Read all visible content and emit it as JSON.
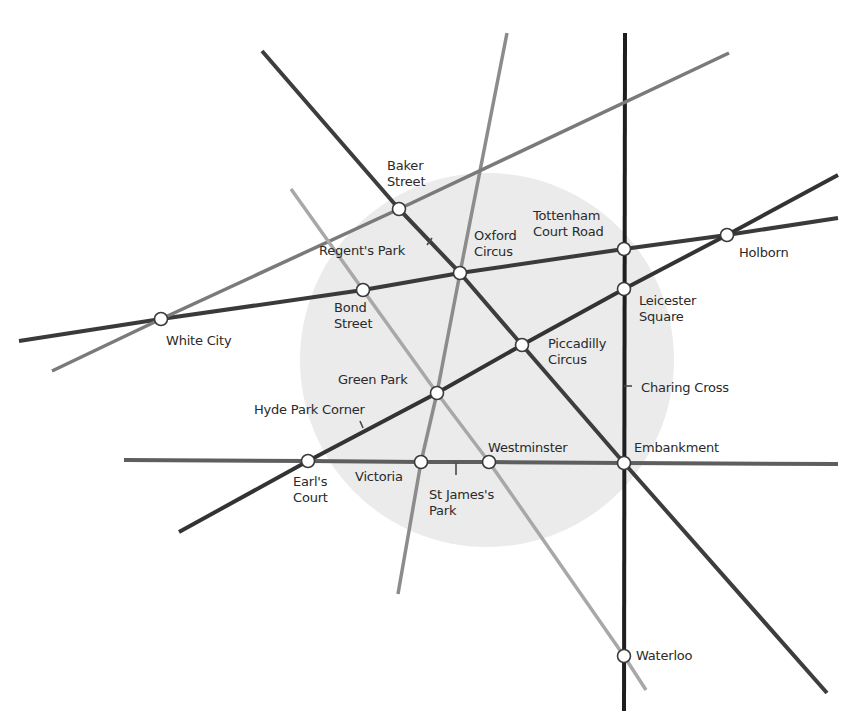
{
  "map": {
    "colors": {
      "background": "#ffffff",
      "zone_fill": "#ebebeb",
      "station_fill": "#ffffff",
      "station_stroke": "#3a3a3a",
      "label": "#2a2a2a"
    },
    "zone": {
      "cx": 487,
      "cy": 360,
      "r": 187
    },
    "lines": [
      {
        "id": "northern",
        "color": "#1e1e1e",
        "width": 4,
        "points": [
          [
            625,
            33
          ],
          [
            624,
            711
          ]
        ]
      },
      {
        "id": "bakerloo",
        "color": "#3d3d3d",
        "width": 4,
        "points": [
          [
            262,
            51
          ],
          [
            399,
            209
          ],
          [
            460,
            273
          ],
          [
            522,
            345
          ],
          [
            624,
            463
          ],
          [
            827,
            693
          ]
        ]
      },
      {
        "id": "central",
        "color": "#3a3a3a",
        "width": 4,
        "points": [
          [
            19,
            341
          ],
          [
            161,
            319
          ],
          [
            363,
            290
          ],
          [
            460,
            273
          ],
          [
            624,
            249
          ],
          [
            727,
            235
          ],
          [
            838,
            218
          ]
        ]
      },
      {
        "id": "piccadilly",
        "color": "#333333",
        "width": 4,
        "points": [
          [
            179,
            532
          ],
          [
            308,
            461
          ],
          [
            437,
            393
          ],
          [
            522,
            345
          ],
          [
            624,
            289
          ],
          [
            727,
            235
          ],
          [
            838,
            175
          ]
        ]
      },
      {
        "id": "district",
        "color": "#5e5e5e",
        "width": 4,
        "points": [
          [
            124,
            460
          ],
          [
            308,
            461
          ],
          [
            421,
            462
          ],
          [
            489,
            462
          ],
          [
            624,
            463
          ],
          [
            838,
            464
          ]
        ]
      },
      {
        "id": "victoria",
        "color": "#8c8c8c",
        "width": 3.5,
        "points": [
          [
            507,
            33
          ],
          [
            460,
            273
          ],
          [
            437,
            393
          ],
          [
            421,
            462
          ],
          [
            398,
            594
          ]
        ]
      },
      {
        "id": "metropolitan",
        "color": "#7a7a7a",
        "width": 3.5,
        "points": [
          [
            52,
            371
          ],
          [
            161,
            319
          ],
          [
            399,
            209
          ],
          [
            729,
            53
          ]
        ]
      },
      {
        "id": "jubilee",
        "color": "#a8a8a8",
        "width": 3.5,
        "points": [
          [
            291,
            189
          ],
          [
            363,
            290
          ],
          [
            437,
            393
          ],
          [
            489,
            462
          ],
          [
            624,
            656
          ],
          [
            646,
            690
          ]
        ]
      }
    ],
    "ticks": [
      {
        "station": "Regent's Park",
        "points": [
          [
            427,
            245
          ],
          [
            432,
            238
          ]
        ]
      },
      {
        "station": "Hyde Park Corner",
        "points": [
          [
            363,
            428
          ],
          [
            360,
            421
          ]
        ]
      },
      {
        "station": "St James's Park",
        "points": [
          [
            456,
            463
          ],
          [
            456,
            475
          ]
        ]
      },
      {
        "station": "Charing Cross",
        "points": [
          [
            624,
            386
          ],
          [
            632,
            386
          ]
        ]
      }
    ],
    "stations": [
      {
        "name": "Baker Street",
        "x": 399,
        "y": 209
      },
      {
        "name": "Oxford Circus",
        "x": 460,
        "y": 273
      },
      {
        "name": "Bond Street",
        "x": 363,
        "y": 290
      },
      {
        "name": "White City",
        "x": 161,
        "y": 319
      },
      {
        "name": "Tottenham Court Road",
        "x": 624,
        "y": 249
      },
      {
        "name": "Holborn",
        "x": 727,
        "y": 235
      },
      {
        "name": "Leicester Square",
        "x": 624,
        "y": 289
      },
      {
        "name": "Piccadilly Circus",
        "x": 522,
        "y": 345
      },
      {
        "name": "Green Park",
        "x": 437,
        "y": 393
      },
      {
        "name": "Earl's Court",
        "x": 308,
        "y": 461
      },
      {
        "name": "Victoria",
        "x": 421,
        "y": 462
      },
      {
        "name": "Westminster",
        "x": 489,
        "y": 462
      },
      {
        "name": "Embankment",
        "x": 624,
        "y": 463
      },
      {
        "name": "Waterloo",
        "x": 624,
        "y": 656
      }
    ],
    "labels": {
      "baker_street": {
        "l1": "Baker",
        "l2": "Street"
      },
      "regents_park": {
        "l1": "Regent's Park"
      },
      "oxford_circus": {
        "l1": "Oxford",
        "l2": "Circus"
      },
      "tottenham_court_road": {
        "l1": "Tottenham",
        "l2": "Court Road"
      },
      "holborn": {
        "l1": "Holborn"
      },
      "bond_street": {
        "l1": "Bond",
        "l2": "Street"
      },
      "white_city": {
        "l1": "White City"
      },
      "leicester_square": {
        "l1": "Leicester",
        "l2": "Square"
      },
      "piccadilly_circus": {
        "l1": "Piccadilly",
        "l2": "Circus"
      },
      "charing_cross": {
        "l1": "Charing Cross"
      },
      "green_park": {
        "l1": "Green Park"
      },
      "hyde_park_corner": {
        "l1": "Hyde Park Corner"
      },
      "westminster": {
        "l1": "Westminster"
      },
      "embankment": {
        "l1": "Embankment"
      },
      "earls_court": {
        "l1": "Earl's",
        "l2": "Court"
      },
      "victoria": {
        "l1": "Victoria"
      },
      "st_james_park": {
        "l1": "St James's",
        "l2": "Park"
      },
      "waterloo": {
        "l1": "Waterloo"
      }
    }
  }
}
